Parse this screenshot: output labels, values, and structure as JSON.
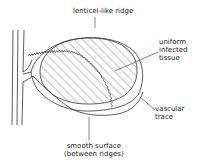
{
  "figure": {
    "labels": {
      "lenticel_ridge": "lenticel-like ridge",
      "infected_tissue": [
        "uniform",
        "infected",
        "tissue"
      ],
      "vascular_trace": [
        "vascular",
        "trace"
      ],
      "smooth_surface": [
        "smooth surface",
        "(between ridges)"
      ]
    },
    "colors": {
      "line": "#333333",
      "background": "#ffffff"
    }
  }
}
